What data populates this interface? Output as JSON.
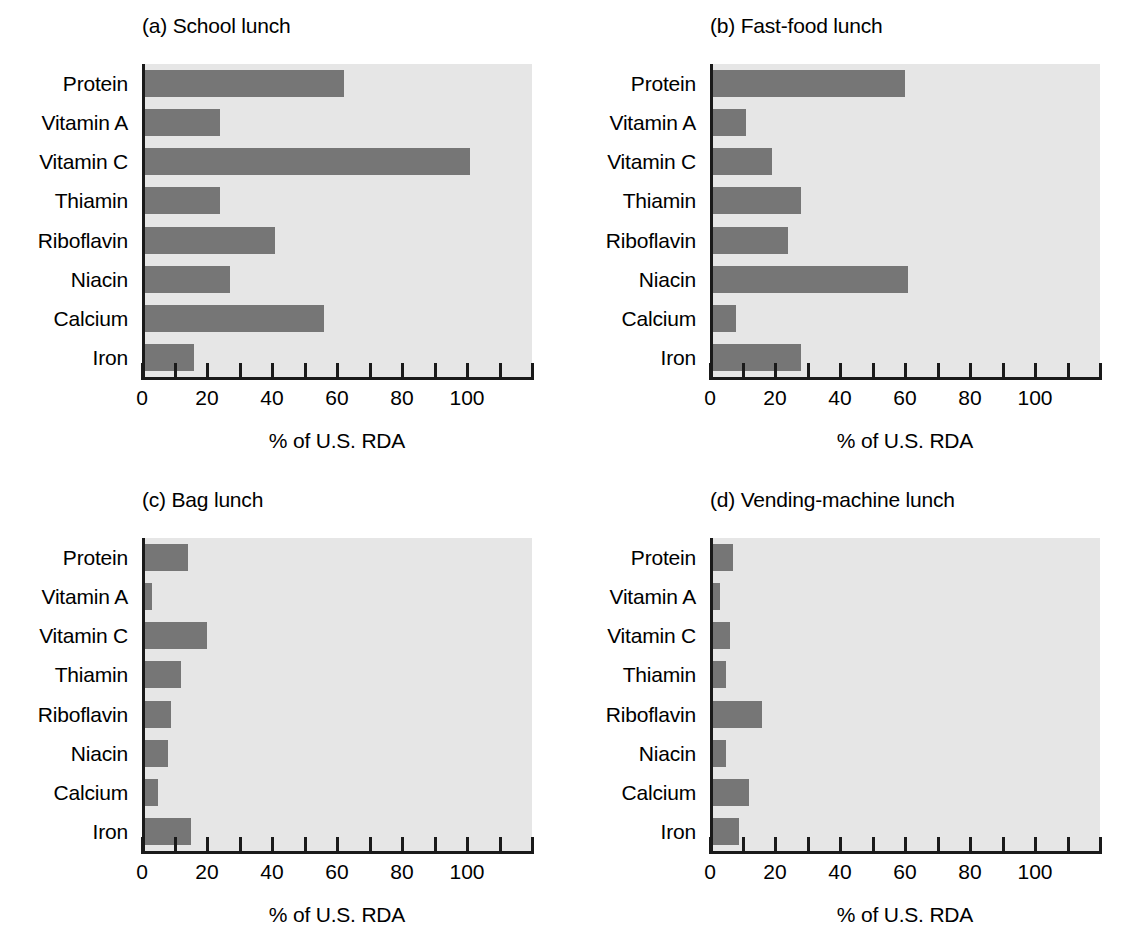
{
  "figure": {
    "background_color": "#ffffff",
    "bar_color": "#767676",
    "plot_background_color": "#e6e6e6",
    "axis_color": "#1a1a1a"
  },
  "chart_data": {
    "type": "bar",
    "orientation": "horizontal",
    "title": "",
    "xlabel": "% of U.S. RDA",
    "ylabel": "",
    "xlim": [
      0,
      120
    ],
    "grid": false,
    "legend": "none",
    "xticks": [
      0,
      10,
      20,
      30,
      40,
      50,
      60,
      70,
      80,
      90,
      100,
      110,
      120
    ],
    "xtick_labels": [
      "0",
      "",
      "20",
      "",
      "40",
      "",
      "60",
      "",
      "80",
      "",
      "100",
      "",
      ""
    ],
    "labeled_xticks": [
      {
        "value": 0,
        "label": "0"
      },
      {
        "value": 20,
        "label": "20"
      },
      {
        "value": 40,
        "label": "40"
      },
      {
        "value": 60,
        "label": "60"
      },
      {
        "value": 80,
        "label": "80"
      },
      {
        "value": 100,
        "label": "100"
      }
    ],
    "categories": [
      "Protein",
      "Vitamin A",
      "Vitamin C",
      "Thiamin",
      "Riboflavin",
      "Niacin",
      "Calcium",
      "Iron"
    ],
    "panels": [
      {
        "id": "a",
        "title": "(a) School lunch",
        "xlabel": "% of U.S. RDA",
        "values": [
          62,
          24,
          101,
          24,
          41,
          27,
          56,
          16
        ]
      },
      {
        "id": "b",
        "title": "(b) Fast-food lunch",
        "xlabel": "% of U.S. RDA",
        "values": [
          60,
          11,
          19,
          28,
          24,
          61,
          8,
          28
        ]
      },
      {
        "id": "c",
        "title": "(c) Bag lunch",
        "xlabel": "% of U.S. RDA",
        "values": [
          14,
          3,
          20,
          12,
          9,
          8,
          5,
          15
        ]
      },
      {
        "id": "d",
        "title": "(d) Vending-machine lunch",
        "xlabel": "% of U.S. RDA",
        "values": [
          7,
          3,
          6,
          5,
          16,
          5,
          12,
          9
        ]
      }
    ]
  }
}
